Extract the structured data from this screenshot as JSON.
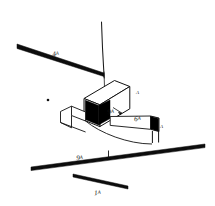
{
  "figure": {
    "background_color": "#ffffff",
    "ink_color": "#111111",
    "fill_color": "#000000"
  },
  "labels": [
    {
      "id": "label-4a",
      "text": "4A",
      "number": "4",
      "suffix": "A",
      "x": 52,
      "y": 43,
      "rotate": -9,
      "target": "upper-left-thick-line"
    },
    {
      "id": "label-9a-beam",
      "text": "9A",
      "number": "9",
      "suffix": "A",
      "x": 108,
      "y": 103,
      "rotate": -6,
      "target": "beam-leader-arrow"
    },
    {
      "id": "label-6a",
      "text": "6A",
      "number": "6",
      "suffix": "A",
      "x": 134,
      "y": 109,
      "rotate": -4,
      "target": "beam-body"
    },
    {
      "id": "label-9a-ground",
      "text": "9A",
      "number": "9",
      "suffix": "A",
      "x": 76,
      "y": 148,
      "rotate": -5,
      "target": "long-ground-line"
    },
    {
      "id": "label-1a",
      "text": "1A",
      "number": "1",
      "suffix": "A",
      "x": 94,
      "y": 183,
      "rotate": -4,
      "target": "short-lower-line"
    }
  ],
  "letter_marks": [
    {
      "id": "letter-a-box",
      "text": "A",
      "x": 136,
      "y": 91
    },
    {
      "id": "letter-a-beam-end",
      "text": "A",
      "x": 159,
      "y": 126
    }
  ],
  "elements": {
    "vertical_probe_line": "thin near-vertical line descending from top into the block",
    "upper_left_thick_line": "thick tapered diagonal line at upper left labelled 4A",
    "long_ground_line": "long thick diagonal line across the lower half labelled 9A with a tick mark",
    "short_lower_line": "short thick diagonal line near the bottom labelled 1A",
    "block": "isometric rectangular block with a black (shaded) cavity opening on its left face",
    "beam": "thin outlined beam passing through the block, black end face at right labelled A",
    "dot_marker": "small solid dot at mid-left of the drawing",
    "tick_marker": "short vertical tick crossing the long ground line"
  }
}
